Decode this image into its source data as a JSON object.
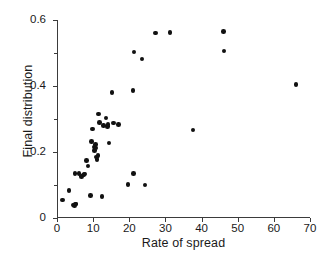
{
  "figure": {
    "background": "#ffffff",
    "marker_color": "#111111",
    "axis_color": "#3b3b3b",
    "text_color": "#1a1a1a"
  },
  "caption": {
    "text": ""
  },
  "chart_data": {
    "type": "scatter",
    "title": "",
    "xlabel": "Rate of spread",
    "ylabel": "Final distribution",
    "xlim": [
      0,
      70
    ],
    "ylim": [
      0,
      0.6
    ],
    "xticks": [
      0,
      10,
      20,
      30,
      40,
      50,
      60,
      70
    ],
    "xticklabels": [
      "0",
      "10",
      "20",
      "30",
      "40",
      "50",
      "60",
      "70"
    ],
    "yticks": [
      0,
      0.2,
      0.4,
      0.6
    ],
    "yticklabels": [
      "0",
      "0.2",
      "0.4",
      "0.6"
    ],
    "yminorticks": [
      0.1,
      0.3,
      0.5
    ],
    "grid": false,
    "legend": null,
    "marker": "filled-circle",
    "series": [
      {
        "name": "observations",
        "points": [
          [
            1.5,
            0.055
          ],
          [
            3.3,
            0.083
          ],
          [
            4.4,
            0.04
          ],
          [
            4.9,
            0.037
          ],
          [
            5.1,
            0.043
          ],
          [
            5.3,
            0.042
          ],
          [
            5.0,
            0.135
          ],
          [
            6.1,
            0.135
          ],
          [
            6.8,
            0.125
          ],
          [
            7.2,
            0.13
          ],
          [
            7.5,
            0.132
          ],
          [
            7.8,
            0.133
          ],
          [
            8.1,
            0.175
          ],
          [
            8.6,
            0.158
          ],
          [
            9.2,
            0.068
          ],
          [
            9.6,
            0.232
          ],
          [
            9.9,
            0.27
          ],
          [
            10.2,
            0.215
          ],
          [
            10.4,
            0.205
          ],
          [
            10.6,
            0.212
          ],
          [
            10.7,
            0.222
          ],
          [
            10.9,
            0.185
          ],
          [
            11.1,
            0.178
          ],
          [
            11.3,
            0.19
          ],
          [
            11.5,
            0.315
          ],
          [
            11.8,
            0.29
          ],
          [
            12.4,
            0.065
          ],
          [
            12.9,
            0.28
          ],
          [
            13.6,
            0.303
          ],
          [
            13.9,
            0.278
          ],
          [
            14.1,
            0.283
          ],
          [
            14.4,
            0.227
          ],
          [
            15.2,
            0.38
          ],
          [
            15.6,
            0.288
          ],
          [
            17.0,
            0.283
          ],
          [
            19.6,
            0.102
          ],
          [
            21.0,
            0.386
          ],
          [
            21.1,
            0.134
          ],
          [
            21.3,
            0.503
          ],
          [
            23.5,
            0.482
          ],
          [
            24.3,
            0.1
          ],
          [
            27.2,
            0.56
          ],
          [
            31.3,
            0.562
          ],
          [
            37.6,
            0.267
          ],
          [
            46.0,
            0.566
          ],
          [
            46.2,
            0.506
          ],
          [
            66.1,
            0.405
          ]
        ]
      }
    ]
  }
}
